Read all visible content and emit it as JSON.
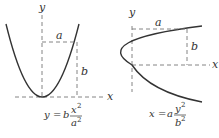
{
  "figures": [
    {
      "name": "vertical-parabola",
      "axes": {
        "x_label": "x",
        "y_label": "y"
      },
      "dimension_labels": {
        "horizontal": "a",
        "vertical": "b"
      },
      "equation": {
        "lhs": "y",
        "equals": "=",
        "coef": "b",
        "num_var": "x",
        "num_exp": "2",
        "den_var": "a",
        "den_exp": "2",
        "text": "y = b x^2 / a^2"
      }
    },
    {
      "name": "horizontal-parabola",
      "axes": {
        "x_label": "x",
        "y_label": "y"
      },
      "dimension_labels": {
        "horizontal": "a",
        "vertical": "b"
      },
      "equation": {
        "lhs": "x",
        "equals": "=",
        "coef": "a",
        "num_var": "y",
        "num_exp": "2",
        "den_var": "b",
        "den_exp": "2",
        "text": "x = a y^2 / b^2"
      }
    }
  ],
  "colors": {
    "curve": "#333333",
    "dashed": "#777777",
    "text": "#333333",
    "background": "#ffffff"
  }
}
